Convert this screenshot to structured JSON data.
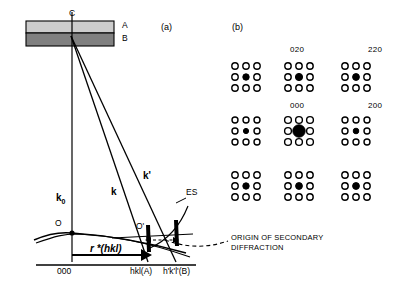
{
  "figure": {
    "background_color": "#ffffff",
    "ink_color": "#000000",
    "panels": [
      {
        "id": "a",
        "tag": "(a)",
        "description": "Ewald construction for secondary diffraction from a two-layer specimen"
      },
      {
        "id": "b",
        "tag": "(b)",
        "description": "Resulting diffraction pattern of satellite spot clusters"
      }
    ]
  },
  "panel_a": {
    "tag": "(a)",
    "specimen": {
      "layer_a": {
        "label": "A",
        "fill": "#cccccc",
        "role": "upper crystal layer"
      },
      "layer_b": {
        "label": "B",
        "fill": "#808080",
        "role": "lower crystal layer"
      },
      "interface_point": {
        "label": "C",
        "role": "scattering point at layer interface"
      }
    },
    "vectors": {
      "k0": {
        "label": "k",
        "subscript": "0",
        "role": "incident wavevector"
      },
      "k": {
        "label": "k",
        "subscript": "",
        "role": "diffracted wavevector from layer A"
      },
      "k_prime": {
        "label": "k'",
        "subscript": "",
        "role": "secondary diffracted wavevector from layer B"
      },
      "r_star": {
        "label": "r *(hkl)",
        "role": "reciprocal lattice vector"
      }
    },
    "points": {
      "origin_O": "O",
      "point_O_prime": "O'"
    },
    "curve_label": "ES",
    "curve_label_full": "Ewald sphere",
    "axis_labels": {
      "origin": "000",
      "spot_a": "hkl(A)",
      "spot_b": "h'k'l'(B)"
    },
    "annotation": {
      "line1": "ORIGIN OF SECONDARY",
      "line2": "DIFFRACTION"
    }
  },
  "panel_b": {
    "tag": "(b)",
    "spot_labels": [
      {
        "text": "020",
        "x": 290,
        "y": 45
      },
      {
        "text": "220",
        "x": 368,
        "y": 45
      },
      {
        "text": "000",
        "x": 290,
        "y": 101
      },
      {
        "text": "200",
        "x": 368,
        "y": 101
      }
    ],
    "clusters": [
      {
        "cx": 246,
        "cy": 77,
        "center_r": 3.2,
        "center_filled": true,
        "satellite_r": 3.2,
        "name": "cluster-row1-col1"
      },
      {
        "cx": 299,
        "cy": 77,
        "center_r": 3.6,
        "center_filled": true,
        "satellite_r": 3.2,
        "name": "cluster-020"
      },
      {
        "cx": 356,
        "cy": 77,
        "center_r": 3.4,
        "center_filled": true,
        "satellite_r": 3.2,
        "name": "cluster-220"
      },
      {
        "cx": 246,
        "cy": 131,
        "center_r": 2.6,
        "center_filled": true,
        "satellite_r": 3.0,
        "name": "cluster-row2-col1"
      },
      {
        "cx": 299,
        "cy": 131,
        "center_r": 6.2,
        "center_filled": true,
        "satellite_r": 3.4,
        "name": "cluster-000"
      },
      {
        "cx": 356,
        "cy": 131,
        "center_r": 2.8,
        "center_filled": true,
        "satellite_r": 3.0,
        "name": "cluster-200"
      },
      {
        "cx": 246,
        "cy": 186,
        "center_r": 3.2,
        "center_filled": true,
        "satellite_r": 3.2,
        "name": "cluster-row3-col1"
      },
      {
        "cx": 299,
        "cy": 186,
        "center_r": 3.4,
        "center_filled": true,
        "satellite_r": 3.2,
        "name": "cluster-row3-col2"
      },
      {
        "cx": 356,
        "cy": 186,
        "center_r": 3.4,
        "center_filled": true,
        "satellite_r": 3.2,
        "name": "cluster-row3-col3"
      }
    ],
    "cluster_spacing": 11,
    "legend": {
      "open_circle": "secondary / satellite reflection",
      "filled_circle": "primary reflection"
    }
  }
}
